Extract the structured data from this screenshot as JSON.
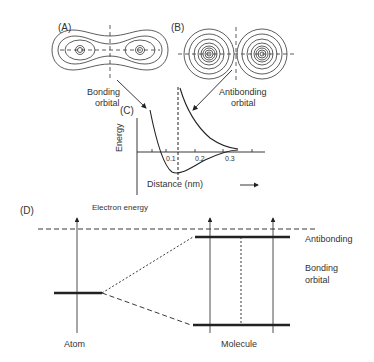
{
  "panels": {
    "A": {
      "label": "(A)",
      "caption": [
        "Bonding",
        "orbital"
      ]
    },
    "B": {
      "label": "(B)",
      "caption": [
        "Antibonding",
        "orbital"
      ]
    },
    "C": {
      "label": "(C)",
      "y_axis_label": "Energy",
      "x_axis_label": "Distance (nm)",
      "ticks": [
        "0.1",
        "0.2",
        "0.3"
      ]
    },
    "D": {
      "label": "(D)",
      "axis_label": "Electron energy",
      "atom_label": "Atom",
      "molecule_label": "Molecule",
      "antibonding_label": "Antibonding",
      "bonding_label": [
        "Bonding",
        "orbital"
      ]
    }
  },
  "colors": {
    "line": "#222222",
    "background": "#ffffff"
  }
}
